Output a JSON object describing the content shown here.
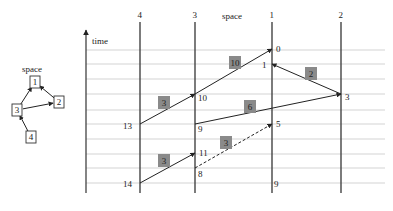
{
  "space_graph": {
    "title": "space",
    "nodes": [
      {
        "id": "1",
        "label": "1",
        "x": 35,
        "y": 82
      },
      {
        "id": "2",
        "label": "2",
        "x": 59,
        "y": 102
      },
      {
        "id": "3",
        "label": "3",
        "x": 17,
        "y": 110
      },
      {
        "id": "4",
        "label": "4",
        "x": 31,
        "y": 137
      }
    ],
    "edges": [
      {
        "from": "3",
        "to": "1"
      },
      {
        "from": "3",
        "to": "2"
      },
      {
        "from": "2",
        "to": "1"
      },
      {
        "from": "4",
        "to": "3"
      }
    ]
  },
  "spacetime": {
    "space_label": "space",
    "time_label": "time",
    "processes": [
      {
        "label": "4",
        "x": 140
      },
      {
        "label": "3",
        "x": 195
      },
      {
        "label": "1",
        "x": 272
      },
      {
        "label": "2",
        "x": 341
      }
    ],
    "gridlines_y": [
      50,
      64,
      79,
      94,
      110,
      124,
      139,
      154,
      168,
      183
    ],
    "events": [
      {
        "label": "0",
        "x": 272,
        "y": 49,
        "lx": 276,
        "ly": 52
      },
      {
        "label": "1",
        "x": 272,
        "y": 64,
        "lx": 262,
        "ly": 68
      },
      {
        "label": "3",
        "x": 341,
        "y": 94,
        "lx": 345,
        "ly": 100
      },
      {
        "label": "10",
        "x": 195,
        "y": 94,
        "lx": 198,
        "ly": 101
      },
      {
        "label": "13",
        "x": 140,
        "y": 124,
        "lx": 123,
        "ly": 129
      },
      {
        "label": "9",
        "x": 195,
        "y": 124,
        "lx": 198,
        "ly": 132
      },
      {
        "label": "5",
        "x": 272,
        "y": 124,
        "lx": 276,
        "ly": 127
      },
      {
        "label": "11",
        "x": 195,
        "y": 153,
        "lx": 199,
        "ly": 156
      },
      {
        "label": "8",
        "x": 195,
        "y": 168,
        "lx": 198,
        "ly": 177
      },
      {
        "label": "14",
        "x": 140,
        "y": 183,
        "lx": 123,
        "ly": 187
      },
      {
        "label": "9",
        "x": 272,
        "y": 183,
        "lx": 274,
        "ly": 187
      }
    ],
    "messages": [
      {
        "x1": 195,
        "y1": 94,
        "x2": 272,
        "y2": 49,
        "weight": "10",
        "wx": 235,
        "wy": 63,
        "dashed": false
      },
      {
        "x1": 341,
        "y1": 94,
        "x2": 272,
        "y2": 64,
        "weight": "2",
        "wx": 311,
        "wy": 74,
        "dashed": false
      },
      {
        "x1": 140,
        "y1": 124,
        "x2": 195,
        "y2": 94,
        "weight": "3",
        "wx": 164,
        "wy": 103,
        "dashed": false
      },
      {
        "x1": 195,
        "y1": 124,
        "x2": 341,
        "y2": 94,
        "weight": "6",
        "wx": 250,
        "wy": 107,
        "dashed": false
      },
      {
        "x1": 195,
        "y1": 168,
        "x2": 272,
        "y2": 124,
        "weight": "3",
        "wx": 226,
        "wy": 143,
        "dashed": true
      },
      {
        "x1": 140,
        "y1": 183,
        "x2": 195,
        "y2": 153,
        "weight": "3",
        "wx": 164,
        "wy": 161,
        "dashed": false
      }
    ]
  },
  "colors": {
    "line": "#333333",
    "grid": "#c8c8c8",
    "weight_box": "#8a8a8a"
  }
}
